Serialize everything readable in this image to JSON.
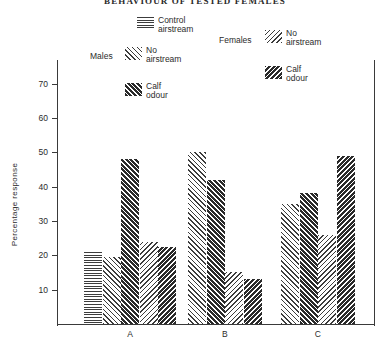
{
  "chart_data": {
    "type": "bar",
    "title": "BEHAVIOUR OF TESTED FEMALES",
    "xlabel": "",
    "ylabel": "Percentage response",
    "ylim": [
      0,
      75
    ],
    "yticks": [
      10,
      20,
      30,
      40,
      50,
      60,
      70
    ],
    "ytick_labels": [
      "10",
      "20",
      "30",
      "40",
      "50",
      "60",
      "70"
    ],
    "categories": [
      "A",
      "B",
      "C"
    ],
    "grid": false,
    "legend_position": "top",
    "series": [
      {
        "name": "Males Control airstream",
        "sex": "Males",
        "treatment": "Control airstream",
        "pattern": "horizontal-lines",
        "values": [
          21,
          null,
          null
        ]
      },
      {
        "name": "Males No airstream",
        "sex": "Males",
        "treatment": "No airstream",
        "pattern": "diagonal-light",
        "values": [
          19.5,
          50,
          35
        ]
      },
      {
        "name": "Males Calf odour",
        "sex": "Males",
        "treatment": "Calf odour",
        "pattern": "diagonal-dark",
        "values": [
          48,
          42,
          38
        ]
      },
      {
        "name": "Females No airstream",
        "sex": "Females",
        "treatment": "No airstream",
        "pattern": "reverse-diagonal-light",
        "values": [
          24,
          15,
          26
        ]
      },
      {
        "name": "Females Calf odour",
        "sex": "Females",
        "treatment": "Calf odour",
        "pattern": "reverse-diagonal-dark",
        "values": [
          22.5,
          13,
          49
        ]
      }
    ]
  },
  "legend": {
    "males_group_label": "Males",
    "females_group_label": "Females",
    "control_airstream": {
      "line1": "Control",
      "line2": "airstream"
    },
    "males_no_airstream": {
      "line1": "No",
      "line2": "airstream"
    },
    "males_calf_odour": {
      "line1": "Calf",
      "line2": "odour"
    },
    "females_no_airstream": {
      "line1": "No",
      "line2": "airstream"
    },
    "females_calf_odour": {
      "line1": "Calf",
      "line2": "odour"
    }
  },
  "axes": {
    "y_title": "Percentage  response",
    "y_labels": [
      "70",
      "60",
      "50",
      "40",
      "30",
      "20",
      "10"
    ],
    "x_labels": [
      "A",
      "B",
      "C"
    ]
  }
}
